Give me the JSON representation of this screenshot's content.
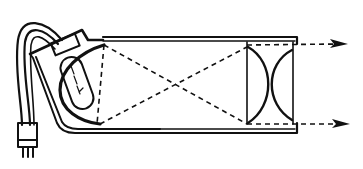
{
  "diagram": {
    "type": "optical-projector-schematic",
    "title": "",
    "components": [
      {
        "name": "power-cord",
        "label": ""
      },
      {
        "name": "plug",
        "label": ""
      },
      {
        "name": "lamp-housing",
        "label": ""
      },
      {
        "name": "lamp-bulb",
        "label": ""
      },
      {
        "name": "concave-reflector",
        "label": ""
      },
      {
        "name": "tube-body",
        "label": ""
      },
      {
        "name": "condenser-lens-pair",
        "label": ""
      },
      {
        "name": "output-beam-arrows",
        "label": ""
      }
    ],
    "colors": {
      "ink": "#111111",
      "background": "#ffffff"
    }
  }
}
